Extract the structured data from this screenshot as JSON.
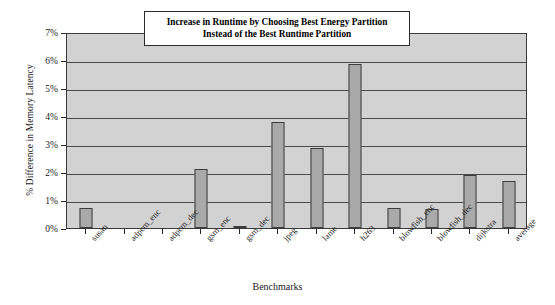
{
  "chart_data": {
    "type": "bar",
    "title": "Increase in Runtime by Choosing Best Energy Partition Instead of the Best Runtime Partition",
    "title_line1": "Increase in Runtime by Choosing Best Energy Partition",
    "title_line2": "Instead of the Best Runtime Partition",
    "xlabel": "Benchmarks",
    "ylabel": "% Difference in Memory Latency",
    "categories": [
      "susan",
      "adpcm_enc",
      "adpcm_dec",
      "gsm_enc",
      "gsm_dec",
      "jpeg",
      "lame",
      "h263",
      "blowfish_enc",
      "blowfish_dec",
      "dijkstra",
      "average"
    ],
    "values": [
      0.72,
      0.0,
      0.0,
      2.12,
      0.06,
      3.78,
      2.85,
      5.87,
      0.7,
      0.69,
      1.88,
      1.67
    ],
    "ylim": [
      0,
      7
    ],
    "ytick_values": [
      0,
      1,
      2,
      3,
      4,
      5,
      6,
      7
    ],
    "ytick_labels": [
      "0%",
      "1%",
      "2%",
      "3%",
      "4%",
      "5%",
      "6%",
      "7%"
    ],
    "grid": true,
    "legend": "none",
    "bar_color": "#a9a9a9",
    "bar_edge_color": "#3d3d3d",
    "plot_background": "#d2d2d2",
    "gridline_color": "#4a4a4a",
    "axis_color": "#2a2a2a",
    "text_color": "#1a1a1a"
  }
}
